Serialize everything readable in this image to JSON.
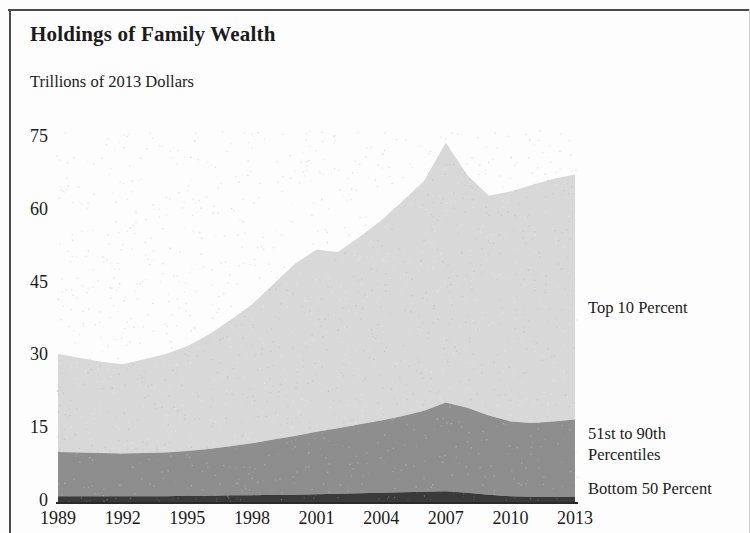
{
  "figure": {
    "title": "Holdings of Family Wealth",
    "subtitle": "Trillions of 2013 Dollars"
  },
  "legend": {
    "top10": "Top 10 Percent",
    "mid_line1": "51st to 90th",
    "mid_line2": "Percentiles",
    "bottom50": "Bottom 50 Percent"
  },
  "axes": {
    "y_ticks": [
      "0",
      "15",
      "30",
      "45",
      "60",
      "75"
    ],
    "x_ticks": [
      "1989",
      "1992",
      "1995",
      "1998",
      "2001",
      "2004",
      "2007",
      "2010",
      "2013"
    ]
  },
  "colors": {
    "top10": "#d8d8d8",
    "mid": "#8e8e8e",
    "bottom50": "#3a3a3a",
    "axis": "#2a2a2a",
    "text": "#1b1b1b",
    "background": "#fdfdfd"
  },
  "chart_data": {
    "type": "area",
    "title": "Holdings of Family Wealth",
    "subtitle": "Trillions of 2013 Dollars",
    "xlabel": "",
    "ylabel": "Trillions of 2013 Dollars",
    "stacked": true,
    "grid": false,
    "legend_position": "right",
    "xlim": [
      1989,
      2013
    ],
    "ylim": [
      0,
      78
    ],
    "yticks": [
      0,
      15,
      30,
      45,
      60,
      75
    ],
    "xticks": [
      1989,
      1992,
      1995,
      1998,
      2001,
      2004,
      2007,
      2010,
      2013
    ],
    "x": [
      1989,
      1990,
      1991,
      1992,
      1993,
      1994,
      1995,
      1996,
      1997,
      1998,
      1999,
      2000,
      2001,
      2002,
      2003,
      2004,
      2005,
      2006,
      2007,
      2008,
      2009,
      2010,
      2011,
      2012,
      2013
    ],
    "series": [
      {
        "name": "Bottom 50 Percent",
        "color": "#3a3a3a",
        "values": [
          1.2,
          1.2,
          1.2,
          1.2,
          1.2,
          1.2,
          1.3,
          1.3,
          1.4,
          1.4,
          1.5,
          1.5,
          1.6,
          1.7,
          1.8,
          1.9,
          2.0,
          2.1,
          2.2,
          1.9,
          1.5,
          1.2,
          1.1,
          1.1,
          1.1
        ]
      },
      {
        "name": "51st to 90th Percentiles",
        "color": "#8e8e8e",
        "values": [
          9.1,
          9.0,
          8.9,
          8.8,
          8.9,
          9.0,
          9.2,
          9.6,
          10.1,
          10.7,
          11.4,
          12.1,
          12.9,
          13.5,
          14.2,
          14.9,
          15.7,
          16.7,
          18.3,
          17.5,
          16.3,
          15.4,
          15.2,
          15.5,
          15.9
        ]
      },
      {
        "name": "Top 10 Percent",
        "color": "#d8d8d8",
        "values": [
          20.2,
          19.5,
          18.8,
          18.4,
          19.3,
          20.3,
          21.6,
          23.6,
          26.0,
          28.6,
          32.0,
          35.5,
          37.5,
          36.3,
          38.6,
          41.2,
          44.3,
          47.4,
          53.5,
          48.0,
          45.3,
          47.4,
          49.0,
          50.0,
          50.5
        ]
      }
    ],
    "totals": [
      30.5,
      29.7,
      28.9,
      28.4,
      29.4,
      30.5,
      32.1,
      34.5,
      37.5,
      40.7,
      44.9,
      49.1,
      52.0,
      51.5,
      54.6,
      58.0,
      62.0,
      66.2,
      74.0,
      67.4,
      63.1,
      64.0,
      65.3,
      66.6,
      67.5
    ]
  }
}
